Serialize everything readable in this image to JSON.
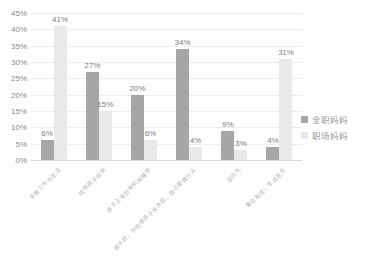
{
  "chart_data": {
    "type": "bar",
    "title": "",
    "xlabel": "",
    "ylabel": "",
    "categories": [
      "平衡工作与生活",
      "陪伴孩子成长",
      "孩子上学后有机会辅导",
      "说不好，不知道孩子长大后，自己能做什么",
      "没代沟",
      "事业有成，生活充实"
    ],
    "series": [
      {
        "name": "全职妈妈",
        "color": "#a6a6a6",
        "values": [
          6,
          27,
          20,
          34,
          9,
          4
        ]
      },
      {
        "name": "职场妈妈",
        "color": "#e9e9e9",
        "values": [
          41,
          15,
          6,
          4,
          3,
          31
        ]
      }
    ],
    "data_labels": [
      "6%",
      "41%",
      "27%",
      "15%",
      "20%",
      "6%",
      "34%",
      "4%",
      "9%",
      "3%",
      "4%",
      "31%"
    ],
    "ylim": [
      0,
      45
    ],
    "ytick_step": 5,
    "ytick_labels": [
      "0%",
      "5%",
      "10%",
      "15%",
      "20%",
      "25%",
      "30%",
      "35%",
      "40%",
      "45%"
    ],
    "grid": "horizontal",
    "legend_position": "right",
    "legend": [
      "全职妈妈",
      "职场妈妈"
    ]
  },
  "style_colors": {
    "background": "#fdfdfd",
    "gridline": "#ededed",
    "axis_line": "#d9d9d9",
    "tick_text": "#8c8c8c",
    "data_label_text": "#7f7f7f",
    "x_label_text": "#b3b3b3",
    "legend_text": "#9a9a9a"
  },
  "layout": {
    "plot": {
      "left": 31,
      "top": 13,
      "width": 271,
      "height": 147
    },
    "bar_width": 13,
    "legend": {
      "left": 301,
      "top": 113
    }
  }
}
